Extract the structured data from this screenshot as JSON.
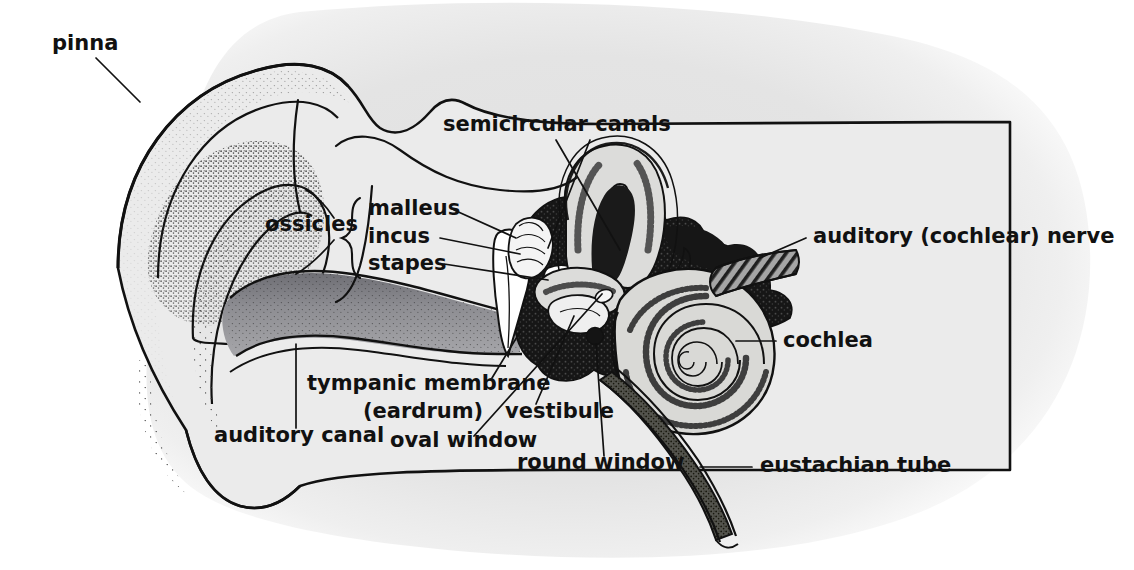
{
  "figure": {
    "background_color": "#ffffff",
    "blob_color": "#e3e3e3",
    "ink_color": "#111111",
    "tissue_fill": "#ebebeb",
    "canal_fill": "#8f8f93",
    "bone_fill": "#161616",
    "cochlea_fill": "#d8d8d6",
    "nerve_fill": "#9a9a9a",
    "ossicle_fill": "#ffffff"
  },
  "labels": [
    {
      "id": "pinna",
      "text": "pinna",
      "x": 52,
      "y": 50,
      "anchor": "start",
      "size": 21
    },
    {
      "id": "semicircular",
      "text": "semicircular canals",
      "x": 443,
      "y": 131,
      "anchor": "start",
      "size": 21
    },
    {
      "id": "ossicles",
      "text": "ossicles",
      "x": 265,
      "y": 231,
      "anchor": "start",
      "size": 21
    },
    {
      "id": "malleus",
      "text": "malleus",
      "x": 368,
      "y": 215,
      "anchor": "start",
      "size": 21
    },
    {
      "id": "incus",
      "text": "incus",
      "x": 368,
      "y": 243,
      "anchor": "start",
      "size": 21
    },
    {
      "id": "stapes",
      "text": "stapes",
      "x": 368,
      "y": 270,
      "anchor": "start",
      "size": 21
    },
    {
      "id": "auditory-nerve",
      "text": "auditory (cochlear) nerve",
      "x": 813,
      "y": 243,
      "anchor": "start",
      "size": 21
    },
    {
      "id": "cochlea",
      "text": "cochlea",
      "x": 783,
      "y": 347,
      "anchor": "start",
      "size": 21
    },
    {
      "id": "tympanic",
      "text": "tympanic membrane",
      "x": 307,
      "y": 390,
      "anchor": "start",
      "size": 21
    },
    {
      "id": "eardrum",
      "text": "(eardrum)",
      "x": 363,
      "y": 418,
      "anchor": "start",
      "size": 21
    },
    {
      "id": "vestibule",
      "text": "vestibule",
      "x": 505,
      "y": 418,
      "anchor": "start",
      "size": 21
    },
    {
      "id": "auditory-canal",
      "text": "auditory canal",
      "x": 214,
      "y": 442,
      "anchor": "start",
      "size": 21
    },
    {
      "id": "oval-window",
      "text": "oval window",
      "x": 390,
      "y": 447,
      "anchor": "start",
      "size": 21
    },
    {
      "id": "round-window",
      "text": "round window",
      "x": 517,
      "y": 469,
      "anchor": "start",
      "size": 21
    },
    {
      "id": "eustachian",
      "text": "eustachian tube",
      "x": 760,
      "y": 472,
      "anchor": "start",
      "size": 21
    }
  ],
  "structures": [
    {
      "id": "pinna",
      "name": "pinna / auricle"
    },
    {
      "id": "auditory-canal",
      "name": "external auditory canal"
    },
    {
      "id": "tympanic-membrane",
      "name": "tympanic membrane (eardrum)"
    },
    {
      "id": "malleus",
      "name": "malleus"
    },
    {
      "id": "incus",
      "name": "incus"
    },
    {
      "id": "stapes",
      "name": "stapes"
    },
    {
      "id": "semicircular-canals",
      "name": "semicircular canals"
    },
    {
      "id": "vestibule",
      "name": "vestibule"
    },
    {
      "id": "oval-window",
      "name": "oval window"
    },
    {
      "id": "round-window",
      "name": "round window"
    },
    {
      "id": "cochlea",
      "name": "cochlea"
    },
    {
      "id": "auditory-nerve",
      "name": "auditory (cochlear) nerve"
    },
    {
      "id": "eustachian-tube",
      "name": "eustachian tube"
    },
    {
      "id": "temporal-bone",
      "name": "temporal bone"
    }
  ]
}
